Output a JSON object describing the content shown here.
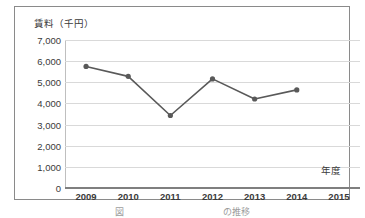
{
  "figure": {
    "caption": "図　　　　　　　　　　　の推移",
    "frame_color": "#8a8a8a"
  },
  "chart_data": {
    "type": "line",
    "title": "",
    "ylabel": "賃料（千円）",
    "xlabel": "年度",
    "categories": [
      "2009",
      "2010",
      "2011",
      "2012",
      "2013",
      "2014",
      "2015"
    ],
    "values": [
      5750,
      5280,
      3430,
      5160,
      4210,
      4640,
      null
    ],
    "ylim": [
      0,
      7000
    ],
    "ytick_step": 1000,
    "ytick_labels": [
      "7,000",
      "6,000",
      "5,000",
      "4,000",
      "3,000",
      "2,000",
      "1,000",
      "0"
    ],
    "ytick_values": [
      7000,
      6000,
      5000,
      4000,
      3000,
      2000,
      1000,
      0
    ],
    "grid": true,
    "legend": false,
    "series": [
      {
        "name": "賃料",
        "values": [
          5750,
          5280,
          3430,
          5160,
          4210,
          4640,
          null
        ],
        "line_color": "#595959",
        "marker_color": "#595959",
        "marker": "circle"
      }
    ],
    "gridline_color": "#d9d9d9",
    "axis_color": "#7f7f7f"
  }
}
